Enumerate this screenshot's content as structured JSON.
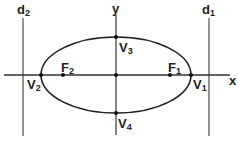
{
  "diagram": {
    "type": "ellipse-with-directrices",
    "colors": {
      "stroke": "#222222",
      "guide": "#555555",
      "background": "#ffffff"
    },
    "axes": {
      "x_label": "x",
      "y_label": "y"
    },
    "directrices": [
      {
        "id": "d2",
        "label": "d",
        "sub": "2"
      },
      {
        "id": "d1",
        "label": "d",
        "sub": "1"
      }
    ],
    "vertices": [
      {
        "id": "V1",
        "label": "V",
        "sub": "1"
      },
      {
        "id": "V2",
        "label": "V",
        "sub": "2"
      },
      {
        "id": "V3",
        "label": "V",
        "sub": "3"
      },
      {
        "id": "V4",
        "label": "V",
        "sub": "4"
      }
    ],
    "foci": [
      {
        "id": "F1",
        "label": "F",
        "sub": "1"
      },
      {
        "id": "F2",
        "label": "F",
        "sub": "2"
      }
    ]
  }
}
